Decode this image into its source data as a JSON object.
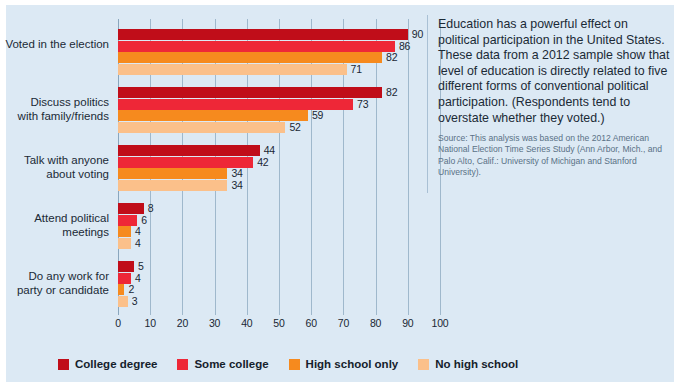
{
  "panel": {
    "background_color": "#dce9f4"
  },
  "sidetext": {
    "lede": "Education has a powerful effect on political participation in the United States. These data from a 2012 sample show that level of education is directly related to five different forms of conventional political participation. (Respondents tend to overstate whether they voted.)",
    "source": "Source: This analysis was based on the 2012 American National Election Time Series Study (Ann Arbor, Mich., and Palo Alto, Calif.: University of Michigan and Stanford University)."
  },
  "chart_data": {
    "type": "bar",
    "orientation": "horizontal",
    "title": "",
    "xlabel": "",
    "ylabel": "",
    "xlim": [
      0,
      100
    ],
    "xticks": [
      0,
      10,
      20,
      30,
      40,
      50,
      60,
      70,
      80,
      90,
      100
    ],
    "grid": true,
    "legend_position": "bottom",
    "categories": [
      "Voted in the election",
      "Discuss politics\nwith family/friends",
      "Talk with anyone\nabout voting",
      "Attend political\nmeetings",
      "Do any work for\nparty or candidate"
    ],
    "series": [
      {
        "name": "College degree",
        "color": "#c00d19",
        "values": [
          90,
          82,
          44,
          8,
          5
        ]
      },
      {
        "name": "Some college",
        "color": "#ee2737",
        "values": [
          86,
          73,
          42,
          6,
          4
        ]
      },
      {
        "name": "High school only",
        "color": "#f68a1e",
        "values": [
          82,
          59,
          34,
          4,
          2
        ]
      },
      {
        "name": "No high school",
        "color": "#fbc08a",
        "values": [
          71,
          52,
          34,
          4,
          3
        ]
      }
    ]
  }
}
